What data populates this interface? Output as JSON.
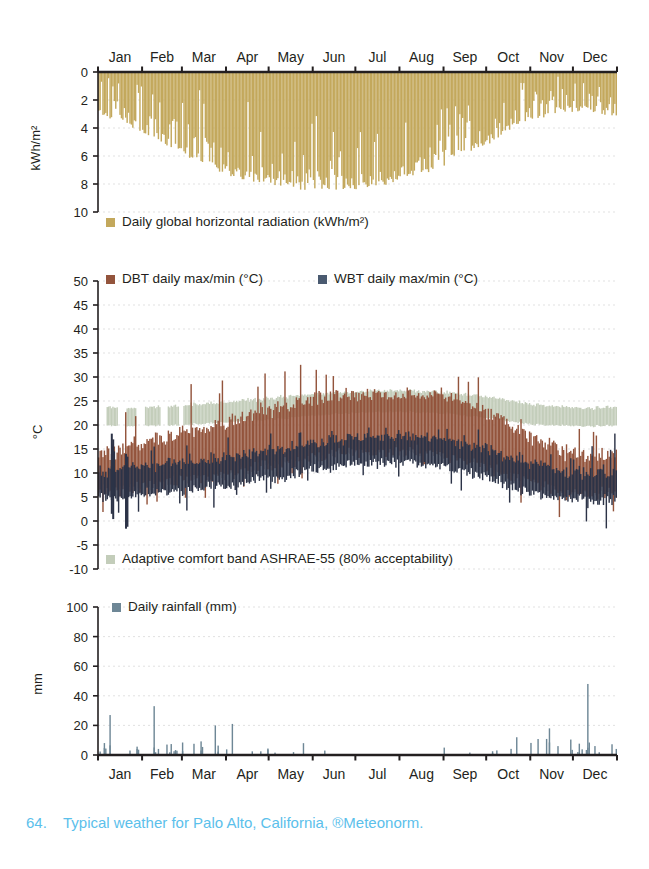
{
  "figure": {
    "caption_number": "64.",
    "caption_text": "Typical weather for Palo Alto, California, ®Meteonorm.",
    "caption_color": "#5bc0eb"
  },
  "months": [
    "Jan",
    "Feb",
    "Mar",
    "Apr",
    "May",
    "Jun",
    "Jul",
    "Aug",
    "Sep",
    "Oct",
    "Nov",
    "Dec"
  ],
  "colors": {
    "radiation": "#c3a85c",
    "dbt": "#93543c",
    "wbt": "#2c3347",
    "comfort_band": "#c3cdba",
    "rainfall": "#6e8796",
    "axis": "#231f20",
    "grid": "#d9d9d9"
  },
  "panels": {
    "radiation": {
      "ylabel": "kWh/m²",
      "yticks": [
        0,
        2,
        4,
        6,
        8,
        10
      ],
      "ylim": [
        0,
        10
      ],
      "inverted": true,
      "legend": [
        {
          "label": "Daily global horizontal radiation (kWh/m²)",
          "swatch": "#c3a85c"
        }
      ]
    },
    "temperature": {
      "ylabel": "°C",
      "yticks": [
        50,
        45,
        40,
        35,
        30,
        25,
        20,
        15,
        10,
        5,
        0,
        -5,
        -10
      ],
      "ylim": [
        -10,
        50
      ],
      "legend": [
        {
          "label": "DBT daily max/min (°C)",
          "swatch": "#93543c"
        },
        {
          "label": "WBT daily max/min (°C)",
          "swatch": "#4a5a70"
        }
      ],
      "legend_bottom": [
        {
          "label": "Adaptive comfort band ASHRAE-55 (80% acceptability)",
          "swatch": "#c3cdba"
        }
      ]
    },
    "rainfall": {
      "ylabel": "mm",
      "yticks": [
        0,
        20,
        40,
        60,
        80,
        100
      ],
      "ylim": [
        0,
        100
      ],
      "legend": [
        {
          "label": "Daily rainfall (mm)",
          "swatch": "#6e8796"
        }
      ]
    }
  },
  "chart_data": {
    "type": "area",
    "title": "Typical weather for Palo Alto, California",
    "xlabel": "",
    "x_ticklabels": [
      "Jan",
      "Feb",
      "Mar",
      "Apr",
      "May",
      "Jun",
      "Jul",
      "Aug",
      "Sep",
      "Oct",
      "Nov",
      "Dec"
    ],
    "x_unit": "day of year",
    "x": [
      1,
      365
    ],
    "grid": true,
    "legend_position": "inside-top-left",
    "subplots": [
      {
        "name": "daily_global_horizontal_radiation",
        "type": "bar",
        "ylabel": "kWh/m²",
        "ylim": [
          0,
          10
        ],
        "y_inverted": true,
        "yticks": [
          0,
          2,
          4,
          6,
          8,
          10
        ],
        "series": [
          {
            "name": "Daily global horizontal radiation (kWh/m²)",
            "color": "#c3a85c",
            "monthly_mean": [
              2.1,
              3.0,
              4.3,
              5.8,
              6.8,
              7.4,
              7.5,
              6.8,
              5.6,
              4.0,
              2.5,
              1.9
            ],
            "monthly_max": [
              3.3,
              4.4,
              6.0,
              7.4,
              8.1,
              8.5,
              8.4,
              7.8,
              6.8,
              5.2,
              3.6,
              2.9
            ],
            "monthly_min": [
              0.4,
              0.6,
              0.9,
              1.4,
              2.0,
              3.1,
              4.2,
              3.6,
              2.4,
              1.1,
              0.5,
              0.3
            ]
          }
        ]
      },
      {
        "name": "daily_temperatures",
        "type": "range-band",
        "ylabel": "°C",
        "ylim": [
          -10,
          50
        ],
        "yticks": [
          50,
          45,
          40,
          35,
          30,
          25,
          20,
          15,
          10,
          5,
          0,
          -5,
          -10
        ],
        "series": [
          {
            "name": "DBT daily max/min (°C)",
            "color": "#93543c",
            "monthly_max_mean": [
              14.2,
              16.0,
              18.4,
              20.8,
              23.0,
              25.6,
              26.4,
              26.2,
              26.0,
              22.6,
              17.6,
              14.0
            ],
            "monthly_min_mean": [
              6.0,
              7.4,
              8.6,
              9.8,
              11.6,
              13.4,
              14.4,
              14.4,
              13.6,
              11.2,
              8.0,
              5.8
            ],
            "monthly_abs_max": [
              20.0,
              24.0,
              28.0,
              30.0,
              32.0,
              33.5,
              32.0,
              31.5,
              34.0,
              30.5,
              24.0,
              19.5
            ],
            "monthly_abs_min": [
              0.5,
              2.0,
              3.5,
              5.0,
              7.0,
              9.5,
              11.0,
              11.0,
              9.0,
              6.0,
              2.0,
              0.0
            ]
          },
          {
            "name": "WBT daily max/min (°C)",
            "color": "#2c3347",
            "monthly_max_mean": [
              10.4,
              11.4,
              12.4,
              13.4,
              14.8,
              16.4,
              17.4,
              17.6,
              17.0,
              14.8,
              12.0,
              10.0
            ],
            "monthly_min_mean": [
              4.6,
              5.6,
              6.6,
              7.4,
              9.0,
              10.8,
              12.0,
              12.2,
              11.2,
              8.8,
              6.0,
              4.4
            ],
            "monthly_abs_max": [
              18.0,
              16.0,
              17.0,
              18.0,
              19.0,
              20.0,
              20.5,
              21.0,
              21.0,
              19.0,
              16.0,
              15.0
            ],
            "monthly_abs_min": [
              -1.5,
              1.0,
              2.0,
              3.0,
              5.0,
              7.0,
              8.5,
              9.0,
              7.0,
              3.5,
              0.5,
              -1.0
            ]
          },
          {
            "name": "Adaptive comfort band ASHRAE-55 (80% acceptability)",
            "color": "#c3cdba",
            "band_upper_monthly": [
              23.6,
              23.6,
              24.2,
              24.8,
              25.6,
              26.4,
              27.0,
              27.1,
              26.8,
              25.8,
              24.4,
              23.6
            ],
            "band_lower_monthly": [
              19.8,
              19.8,
              20.1,
              20.6,
              21.2,
              22.0,
              22.6,
              22.7,
              22.4,
              21.4,
              20.2,
              19.8
            ],
            "gaps_in_jan_feb": true
          }
        ]
      },
      {
        "name": "daily_rainfall",
        "type": "bar",
        "ylabel": "mm",
        "ylim": [
          0,
          100
        ],
        "yticks": [
          0,
          20,
          40,
          60,
          80,
          100
        ],
        "series": [
          {
            "name": "Daily rainfall (mm)",
            "color": "#6e8796",
            "monthly_total": [
              78,
              72,
              66,
              34,
              12,
              3,
              1,
              1,
              5,
              26,
              62,
              96
            ],
            "monthly_peak_day": [
              27,
              33,
              20,
              21,
              8,
              3,
              1,
              1,
              5,
              12,
              18,
              48
            ],
            "monthly_wet_days": [
              10,
              10,
              9,
              6,
              3,
              1,
              0,
              0,
              2,
              5,
              8,
              11
            ]
          }
        ]
      }
    ]
  }
}
